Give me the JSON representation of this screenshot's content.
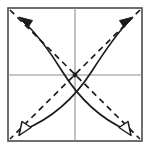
{
  "figure": {
    "title": "Crossed curved arrows within a square with diagonals",
    "type": "geometric-diagram",
    "canvas": {
      "width": 151,
      "height": 150,
      "background": "#ffffff"
    }
  },
  "frame": {
    "name": "square-border",
    "x": 8,
    "y": 8,
    "width": 134,
    "height": 133,
    "stroke": "#4a4a4a",
    "stroke_width": 1.6,
    "fill": "none"
  },
  "axes": {
    "name": "center-crosshair",
    "stroke": "#8e8e8e",
    "stroke_width": 1.1,
    "horizontal": {
      "x1": 8,
      "y1": 75,
      "x2": 142,
      "y2": 75
    },
    "vertical": {
      "x1": 75,
      "y1": 8,
      "x2": 75,
      "y2": 141
    }
  },
  "center_point": {
    "name": "center-dot",
    "cx": 75,
    "cy": 75,
    "r": 2.4,
    "fill": "#1a1a1a"
  },
  "diagonals": [
    {
      "name": "diagonal-dashed-nw-se",
      "x1": 10,
      "y1": 10,
      "x2": 140,
      "y2": 139,
      "stroke": "#1a1a1a",
      "stroke_width": 1.7,
      "dash": "6 4.5"
    },
    {
      "name": "diagonal-dashed-ne-sw",
      "x1": 140,
      "y1": 10,
      "x2": 10,
      "y2": 139,
      "stroke": "#1a1a1a",
      "stroke_width": 1.7,
      "dash": "6 4.5"
    }
  ],
  "curves": [
    {
      "name": "curve-bottomleft-to-topright",
      "label": "Curved arrow from lower-left to upper-right",
      "path": "M 22 132 C 52 120, 75 98, 92 72 C 105 52, 118 34, 130 20",
      "stroke": "#1a1a1a",
      "stroke_width": 1.7,
      "start_arrow": "hollow-triangle",
      "end_arrow": "solid-triangle"
    },
    {
      "name": "curve-bottomright-to-topleft",
      "label": "Curved arrow from lower-right to upper-left",
      "path": "M 128 132 C 100 120, 78 98, 62 72 C 50 52, 36 32, 22 20",
      "stroke": "#1a1a1a",
      "stroke_width": 1.7,
      "start_arrow": "hollow-triangle",
      "end_arrow": "solid-triangle"
    }
  ],
  "arrowheads": [
    {
      "name": "arrowhead-top-left-solid",
      "style": "solid-triangle",
      "fill": "#1a1a1a",
      "direction": "up-left",
      "tip": {
        "x": 20,
        "y": 18
      }
    },
    {
      "name": "arrowhead-top-right-solid",
      "style": "solid-triangle",
      "fill": "#1a1a1a",
      "direction": "up-right",
      "tip": {
        "x": 132,
        "y": 18
      }
    },
    {
      "name": "arrowhead-bottom-left-hollow",
      "style": "hollow-triangle",
      "fill": "#ffffff",
      "stroke": "#1a1a1a",
      "direction": "down-left",
      "tip": {
        "x": 20,
        "y": 134
      }
    },
    {
      "name": "arrowhead-bottom-right-hollow",
      "style": "hollow-triangle",
      "fill": "#ffffff",
      "stroke": "#1a1a1a",
      "direction": "down-right",
      "tip": {
        "x": 130,
        "y": 134
      }
    }
  ],
  "intersections": [
    {
      "name": "curve-crossing-upper",
      "x": 75,
      "y": 43
    },
    {
      "name": "diagonal-crossing-center",
      "x": 75,
      "y": 75
    }
  ]
}
